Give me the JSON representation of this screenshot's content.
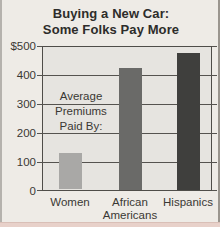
{
  "figure": {
    "background": "#eeebe6",
    "plot_background": "#e6e4e0",
    "grid_color": "#55534f",
    "border_color": "#4f4d49",
    "text_color": "#3a3834",
    "page_edge_pink": "#e8d1ca"
  },
  "chart_data": {
    "type": "bar",
    "title": "Buying a New Car: Some Folks Pay More",
    "title_lines": [
      "Buying a New Car:",
      "Some Folks Pay More"
    ],
    "categories": [
      "Women",
      "African Americans",
      "Hispanics"
    ],
    "category_label_lines": [
      [
        "Women"
      ],
      [
        "African",
        "Americans"
      ],
      [
        "Hispanics"
      ]
    ],
    "values": [
      130,
      425,
      475
    ],
    "bar_colors": [
      "#a9a8a6",
      "#6a6a68",
      "#3f3f3d"
    ],
    "annotation": "Average Premiums Paid By:",
    "annotation_lines": [
      "Average",
      "Premiums",
      "Paid By:"
    ],
    "xlabel": "",
    "ylabel": "",
    "ylim": [
      0,
      500
    ],
    "y_ticks": [
      {
        "value": 500,
        "label": "$500"
      },
      {
        "value": 400,
        "label": "400"
      },
      {
        "value": 300,
        "label": "300"
      },
      {
        "value": 200,
        "label": "200"
      },
      {
        "value": 100,
        "label": "100"
      },
      {
        "value": 0,
        "label": "0"
      }
    ],
    "grid": true,
    "legend_position": "none"
  }
}
